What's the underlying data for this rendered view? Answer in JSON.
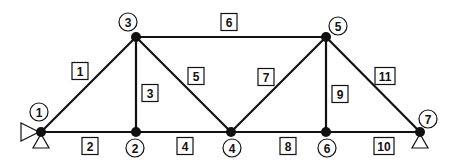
{
  "diagram": {
    "type": "truss",
    "nodes": [
      {
        "id": "1",
        "x": 41,
        "y": 132,
        "lx": 39,
        "ly": 112
      },
      {
        "id": "2",
        "x": 136,
        "y": 132,
        "lx": 135,
        "ly": 148
      },
      {
        "id": "3",
        "x": 136,
        "y": 37,
        "lx": 128,
        "ly": 22
      },
      {
        "id": "4",
        "x": 231,
        "y": 132,
        "lx": 232,
        "ly": 148
      },
      {
        "id": "5",
        "x": 326,
        "y": 37,
        "lx": 338,
        "ly": 26
      },
      {
        "id": "6",
        "x": 326,
        "y": 132,
        "lx": 327,
        "ly": 148
      },
      {
        "id": "7",
        "x": 420,
        "y": 132,
        "lx": 428,
        "ly": 119
      }
    ],
    "elements": [
      {
        "id": "1",
        "from": "1",
        "to": "3",
        "bx": 80,
        "by": 71
      },
      {
        "id": "2",
        "from": "1",
        "to": "2",
        "bx": 90,
        "by": 146
      },
      {
        "id": "3",
        "from": "2",
        "to": "3",
        "bx": 150,
        "by": 93
      },
      {
        "id": "4",
        "from": "2",
        "to": "4",
        "bx": 185,
        "by": 146
      },
      {
        "id": "5",
        "from": "3",
        "to": "4",
        "bx": 196,
        "by": 76
      },
      {
        "id": "6",
        "from": "3",
        "to": "5",
        "bx": 229,
        "by": 22
      },
      {
        "id": "7",
        "from": "4",
        "to": "5",
        "bx": 266,
        "by": 77
      },
      {
        "id": "8",
        "from": "4",
        "to": "6",
        "bx": 288,
        "by": 146
      },
      {
        "id": "9",
        "from": "5",
        "to": "6",
        "bx": 340,
        "by": 94
      },
      {
        "id": "10",
        "from": "6",
        "to": "7",
        "bx": 384,
        "by": 146
      },
      {
        "id": "11",
        "from": "5",
        "to": "7",
        "bx": 385,
        "by": 76
      }
    ],
    "supports": [
      {
        "node": "1",
        "kind": "pin",
        "directions": [
          "horizontal",
          "vertical"
        ]
      },
      {
        "node": "7",
        "kind": "roller",
        "directions": [
          "vertical"
        ]
      }
    ]
  }
}
